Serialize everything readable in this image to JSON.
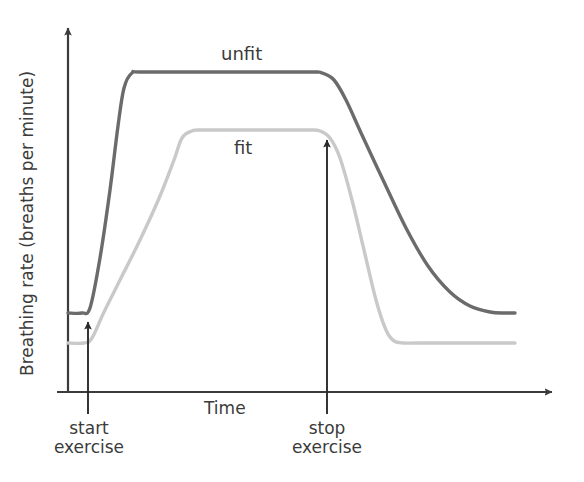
{
  "chart_data": {
    "type": "line",
    "title": "",
    "subtitle": "",
    "xlabel": "Time",
    "ylabel": "Breathing rate (breaths per minute)",
    "xlim": [
      0,
      584
    ],
    "ylim": [
      0,
      482
    ],
    "grid": false,
    "axes_style": "arrow-axes",
    "legend_position": "inline-curve-labels",
    "tick_labels": {
      "x": [],
      "y": []
    },
    "colors": {
      "unfit": "#6b6b6b",
      "fit": "#c9c9c9",
      "axis": "#3b3b3b",
      "annotation": "#2b2b2b",
      "text": "#3b3b3b",
      "background": "#ffffff"
    },
    "annotations": [
      {
        "name": "start-exercise",
        "label_line1": "start",
        "label_line2": "exercise",
        "x_px": 88
      },
      {
        "name": "stop-exercise",
        "label_line1": "stop",
        "label_line2": "exercise",
        "x_px": 327
      }
    ],
    "series": [
      {
        "name": "unfit",
        "label": "unfit",
        "color": "#6b6b6b",
        "baseline_px": 313,
        "plateau_px": 72,
        "recovery_px": 313,
        "rise_start_px": 88,
        "rise_end_px": 128,
        "fall_start_px": 327,
        "fall_end_px": 500,
        "description": "Rises rapidly to a high plateau and recovers slowly after exercise stops",
        "points": [
          [
            68,
            313
          ],
          [
            82,
            313
          ],
          [
            90,
            308
          ],
          [
            100,
            258
          ],
          [
            110,
            190
          ],
          [
            118,
            126
          ],
          [
            124,
            88
          ],
          [
            132,
            73
          ],
          [
            145,
            72
          ],
          [
            240,
            72
          ],
          [
            310,
            72
          ],
          [
            322,
            73
          ],
          [
            334,
            80
          ],
          [
            346,
            100
          ],
          [
            362,
            135
          ],
          [
            384,
            182
          ],
          [
            406,
            228
          ],
          [
            428,
            266
          ],
          [
            450,
            292
          ],
          [
            470,
            306
          ],
          [
            490,
            312
          ],
          [
            505,
            313
          ],
          [
            515,
            313
          ]
        ]
      },
      {
        "name": "fit",
        "label": "fit",
        "color": "#c9c9c9",
        "baseline_px": 343,
        "plateau_px": 130,
        "recovery_px": 343,
        "rise_start_px": 90,
        "rise_end_px": 185,
        "fall_start_px": 322,
        "fall_end_px": 400,
        "description": "Rises more gradually to a lower plateau and recovers quickly after exercise stops",
        "points": [
          [
            68,
            343
          ],
          [
            84,
            343
          ],
          [
            92,
            338
          ],
          [
            104,
            312
          ],
          [
            120,
            280
          ],
          [
            140,
            240
          ],
          [
            160,
            196
          ],
          [
            174,
            160
          ],
          [
            182,
            138
          ],
          [
            192,
            131
          ],
          [
            206,
            130
          ],
          [
            280,
            130
          ],
          [
            310,
            130
          ],
          [
            320,
            131
          ],
          [
            330,
            138
          ],
          [
            340,
            158
          ],
          [
            352,
            200
          ],
          [
            364,
            250
          ],
          [
            376,
            300
          ],
          [
            386,
            330
          ],
          [
            394,
            341
          ],
          [
            404,
            343
          ],
          [
            420,
            343
          ],
          [
            515,
            343
          ]
        ]
      }
    ]
  },
  "figure": {
    "y_axis_title": "Breathing rate (breaths per minute)",
    "x_axis_title": "Time",
    "series_labels": {
      "unfit": "unfit",
      "fit": "fit"
    },
    "annotations": {
      "start": {
        "line1": "start",
        "line2": "exercise"
      },
      "stop": {
        "line1": "stop",
        "line2": "exercise"
      }
    }
  }
}
